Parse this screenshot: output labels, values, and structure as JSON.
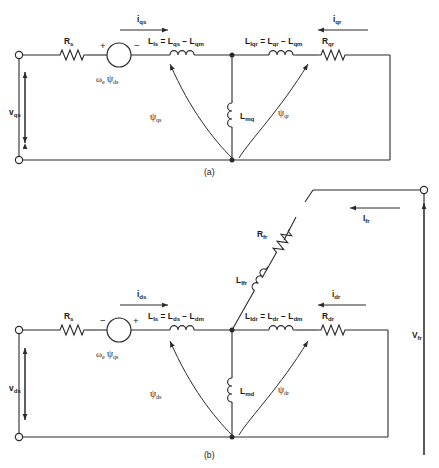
{
  "figure": {
    "kind": "equivalent-circuit-diagram",
    "line_color": "#2b2b2b",
    "text_color": "#1a1a1a",
    "background": "#ffffff"
  },
  "captions": {
    "a": "(a)",
    "b": "(b)"
  },
  "circuit_a": {
    "port_label": "v",
    "port_sub": "qs",
    "stator_resistor": {
      "label": "R",
      "sub": "s"
    },
    "source": {
      "omega": "ω",
      "omega_sub": "e",
      "psi": "ψ",
      "psi_sub": "ds",
      "sign_left": "+",
      "sign_right": "−"
    },
    "stator_current": {
      "label": "i",
      "sub": "qs",
      "direction": "right"
    },
    "stator_inductor": {
      "l": "L",
      "l_sub": "ls",
      "eq": "=",
      "t1": "L",
      "t1_sub": "qs",
      "minus": "−",
      "t2": "L",
      "t2_sub": "qm"
    },
    "mag_inductor": {
      "label": "L",
      "sub": "mq"
    },
    "rotor_inductor": {
      "l": "L",
      "l_sub": "lqr",
      "eq": "=",
      "t1": "L",
      "t1_sub": "qr",
      "minus": "−",
      "t2": "L",
      "t2_sub": "qm"
    },
    "rotor_resistor": {
      "label": "R",
      "sub": "qr"
    },
    "rotor_current": {
      "label": "i",
      "sub": "qr",
      "direction": "left"
    },
    "flux_stator": {
      "psi": "ψ",
      "sub": "qs"
    },
    "flux_rotor": {
      "psi": "ψ",
      "sub": "qr"
    }
  },
  "circuit_b": {
    "port_label": "v",
    "port_sub": "ds",
    "stator_resistor": {
      "label": "R",
      "sub": "s"
    },
    "source": {
      "omega": "ω",
      "omega_sub": "e",
      "psi": "ψ",
      "psi_sub": "qs",
      "sign_left": "−",
      "sign_right": "+"
    },
    "stator_current": {
      "label": "i",
      "sub": "ds",
      "direction": "right"
    },
    "stator_inductor": {
      "l": "L",
      "l_sub": "ls",
      "eq": "=",
      "t1": "L",
      "t1_sub": "ds",
      "minus": "−",
      "t2": "L",
      "t2_sub": "dm"
    },
    "mag_inductor": {
      "label": "L",
      "sub": "md"
    },
    "rotor_inductor": {
      "l": "L",
      "l_sub": "ldr",
      "eq": "=",
      "t1": "L",
      "t1_sub": "dr",
      "minus": "−",
      "t2": "L",
      "t2_sub": "dm"
    },
    "rotor_resistor": {
      "label": "R",
      "sub": "dr"
    },
    "rotor_current": {
      "label": "i",
      "sub": "dr",
      "direction": "left"
    },
    "flux_stator": {
      "psi": "ψ",
      "sub": "ds"
    },
    "flux_rotor": {
      "psi": "ψ",
      "sub": "dr"
    },
    "field_branch": {
      "resistor": {
        "label": "R",
        "sub": "fr"
      },
      "inductor": {
        "label": "L",
        "sub": "lfr"
      },
      "current": {
        "label": "I",
        "sub": "fr",
        "direction": "left"
      },
      "port": {
        "label": "V",
        "sub": "fr"
      }
    }
  }
}
